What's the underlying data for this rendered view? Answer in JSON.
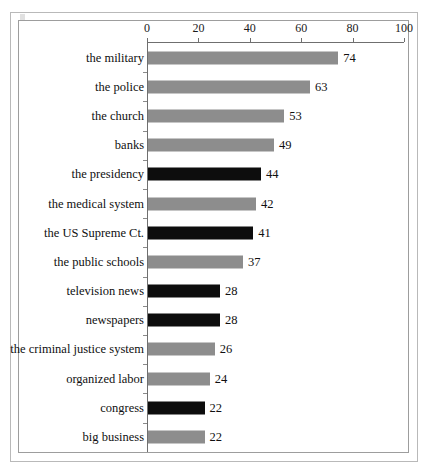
{
  "chart_data": {
    "type": "bar",
    "orientation": "horizontal",
    "title": "",
    "subtitle": "",
    "xlabel": "",
    "ylabel": "",
    "xlim": [
      0,
      100
    ],
    "ylim": null,
    "grid": false,
    "legend": null,
    "axis": {
      "position": "top",
      "ticks": [
        0,
        20,
        40,
        60,
        80,
        100
      ],
      "tick_labels": [
        "0",
        "20",
        "40",
        "60",
        "80",
        "100"
      ],
      "tick_step": 20
    },
    "colors": {
      "gray_bar": "#8d8d8d",
      "black_bar": "#0d0d0d",
      "axis_line": "#6f6f6f",
      "plot_border": "#9d9d9d",
      "page_border": "#b9b9b9",
      "text": "#101010",
      "background": "#ffffff"
    },
    "categories": [
      "the military",
      "the police",
      "the church",
      "banks",
      "the presidency",
      "the medical system",
      "the US Supreme Ct.",
      "the public schools",
      "television news",
      "newspapers",
      "the criminal justice system",
      "organized labor",
      "congress",
      "big business"
    ],
    "values": [
      74,
      63,
      53,
      49,
      44,
      42,
      41,
      37,
      28,
      28,
      26,
      24,
      22,
      22
    ],
    "bar_colors": [
      "gray",
      "gray",
      "gray",
      "gray",
      "black",
      "gray",
      "black",
      "gray",
      "black",
      "black",
      "gray",
      "gray",
      "black",
      "gray"
    ],
    "bars": [
      {
        "label": "the military",
        "value": 74,
        "value_label": "74",
        "color": "gray"
      },
      {
        "label": "the police",
        "value": 63,
        "value_label": "63",
        "color": "gray"
      },
      {
        "label": "the church",
        "value": 53,
        "value_label": "53",
        "color": "gray"
      },
      {
        "label": "banks",
        "value": 49,
        "value_label": "49",
        "color": "gray"
      },
      {
        "label": "the presidency",
        "value": 44,
        "value_label": "44",
        "color": "black"
      },
      {
        "label": "the medical system",
        "value": 42,
        "value_label": "42",
        "color": "gray"
      },
      {
        "label": "the US Supreme Ct.",
        "value": 41,
        "value_label": "41",
        "color": "black"
      },
      {
        "label": "the public schools",
        "value": 37,
        "value_label": "37",
        "color": "gray"
      },
      {
        "label": "television news",
        "value": 28,
        "value_label": "28",
        "color": "black"
      },
      {
        "label": "newspapers",
        "value": 28,
        "value_label": "28",
        "color": "black"
      },
      {
        "label": "the criminal justice system",
        "value": 26,
        "value_label": "26",
        "color": "gray"
      },
      {
        "label": "organized labor",
        "value": 24,
        "value_label": "24",
        "color": "gray"
      },
      {
        "label": "congress",
        "value": 22,
        "value_label": "22",
        "color": "black"
      },
      {
        "label": "big business",
        "value": 22,
        "value_label": "22",
        "color": "gray"
      }
    ]
  }
}
